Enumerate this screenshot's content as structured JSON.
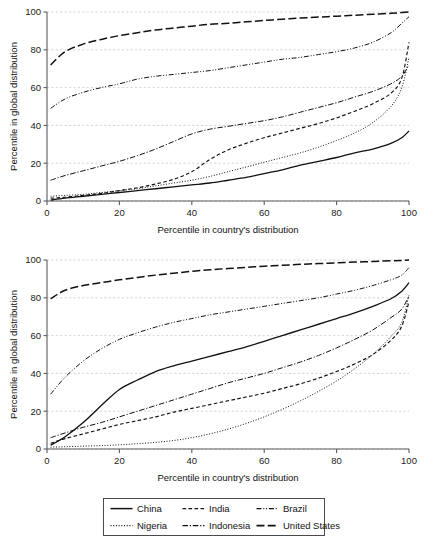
{
  "chart_data": [
    {
      "type": "line",
      "panel": "top",
      "title": "",
      "xlabel": "Percentile in country's distribution",
      "ylabel": "Percentile in global distribution",
      "xlim": [
        0,
        100
      ],
      "ylim": [
        0,
        100
      ],
      "xticks": [
        0,
        20,
        40,
        60,
        80,
        100
      ],
      "yticks": [
        0,
        20,
        40,
        60,
        80,
        100
      ],
      "xtick_labels": [
        "0",
        "20",
        "40",
        "60",
        "80",
        "100"
      ],
      "ytick_labels": [
        "0",
        "20",
        "40",
        "60",
        "80",
        "100"
      ],
      "grid": "horizontal-dashed",
      "legend_position": "below-figure-shared",
      "x": [
        1,
        5,
        10,
        15,
        20,
        25,
        30,
        35,
        40,
        45,
        50,
        55,
        60,
        65,
        70,
        75,
        80,
        85,
        90,
        95,
        98,
        100
      ],
      "series": [
        {
          "name": "China",
          "style": "solid",
          "values": [
            0.5,
            1.5,
            2.5,
            3.5,
            4.5,
            5.5,
            6.5,
            7.5,
            8.5,
            9.5,
            11.0,
            12.5,
            14.5,
            16.5,
            19.0,
            21.0,
            23.0,
            25.5,
            27.5,
            30.5,
            33.5,
            37.0
          ]
        },
        {
          "name": "India",
          "style": "dashed-short",
          "values": [
            1.5,
            2.0,
            3.0,
            4.0,
            5.5,
            7.0,
            9.0,
            11.5,
            15.5,
            22.0,
            27.0,
            30.5,
            33.5,
            36.0,
            38.5,
            41.0,
            44.0,
            47.5,
            51.5,
            57.0,
            65.0,
            84.0
          ]
        },
        {
          "name": "Brazil",
          "style": "dash-dot-dot",
          "values": [
            49.0,
            54.0,
            57.5,
            60.0,
            62.0,
            64.5,
            66.0,
            67.0,
            68.0,
            69.0,
            70.5,
            72.0,
            73.5,
            75.0,
            76.0,
            77.5,
            79.0,
            81.0,
            84.0,
            89.0,
            94.0,
            97.5
          ]
        },
        {
          "name": "Nigeria",
          "style": "dotted",
          "values": [
            2.5,
            3.0,
            3.5,
            4.5,
            5.5,
            6.5,
            8.0,
            9.5,
            11.0,
            13.0,
            15.5,
            18.0,
            20.5,
            23.0,
            25.5,
            28.5,
            32.0,
            36.0,
            41.5,
            50.0,
            60.0,
            76.0
          ]
        },
        {
          "name": "Indonesia",
          "style": "dash-dot",
          "values": [
            11.0,
            13.5,
            16.0,
            18.5,
            21.0,
            24.0,
            27.5,
            31.5,
            35.5,
            38.0,
            39.5,
            41.0,
            42.5,
            44.5,
            47.0,
            49.5,
            52.0,
            55.0,
            58.0,
            62.0,
            66.0,
            72.0
          ]
        },
        {
          "name": "United States",
          "style": "long-dash",
          "values": [
            72.0,
            79.0,
            83.0,
            85.5,
            87.5,
            89.0,
            90.5,
            91.5,
            92.5,
            93.5,
            94.0,
            94.8,
            95.5,
            96.2,
            96.8,
            97.3,
            97.8,
            98.3,
            98.8,
            99.3,
            99.7,
            100.0
          ]
        }
      ]
    },
    {
      "type": "line",
      "panel": "bottom",
      "title": "",
      "xlabel": "Percentile in country's distribution",
      "ylabel": "Percentile in global distribution",
      "xlim": [
        0,
        100
      ],
      "ylim": [
        0,
        100
      ],
      "xticks": [
        0,
        20,
        40,
        60,
        80,
        100
      ],
      "yticks": [
        0,
        20,
        40,
        60,
        80,
        100
      ],
      "xtick_labels": [
        "0",
        "20",
        "40",
        "60",
        "80",
        "100"
      ],
      "ytick_labels": [
        "0",
        "20",
        "40",
        "60",
        "80",
        "100"
      ],
      "grid": "horizontal-dashed",
      "legend_position": "below-figure-shared",
      "x": [
        1,
        5,
        10,
        15,
        20,
        25,
        30,
        35,
        40,
        45,
        50,
        55,
        60,
        65,
        70,
        75,
        80,
        85,
        90,
        95,
        98,
        100
      ],
      "series": [
        {
          "name": "China",
          "style": "solid",
          "values": [
            2.0,
            6.5,
            14.0,
            23.0,
            31.5,
            36.5,
            41.0,
            44.0,
            46.5,
            49.0,
            51.5,
            54.0,
            57.0,
            60.0,
            63.0,
            66.0,
            69.0,
            72.0,
            75.5,
            79.5,
            83.5,
            88.0
          ]
        },
        {
          "name": "India",
          "style": "dashed-short",
          "values": [
            3.0,
            5.5,
            8.0,
            10.5,
            13.0,
            15.0,
            17.0,
            19.5,
            21.5,
            23.5,
            25.5,
            27.5,
            29.5,
            32.0,
            34.5,
            37.5,
            41.0,
            45.0,
            50.0,
            57.5,
            65.0,
            78.0
          ]
        },
        {
          "name": "Brazil",
          "style": "dash-dot-dot",
          "values": [
            29.0,
            38.0,
            46.5,
            53.0,
            58.0,
            61.5,
            64.5,
            67.0,
            69.0,
            71.0,
            72.5,
            74.0,
            75.5,
            77.0,
            78.5,
            80.0,
            82.0,
            84.0,
            86.5,
            89.5,
            92.0,
            96.0
          ]
        },
        {
          "name": "Nigeria",
          "style": "dotted",
          "values": [
            1.0,
            1.2,
            1.5,
            1.8,
            2.2,
            2.8,
            3.5,
            4.5,
            6.0,
            8.0,
            10.5,
            13.5,
            17.0,
            21.0,
            25.5,
            30.5,
            36.0,
            42.5,
            50.0,
            59.5,
            67.0,
            81.5
          ]
        },
        {
          "name": "Indonesia",
          "style": "dash-dot",
          "values": [
            6.0,
            8.5,
            11.5,
            14.0,
            17.0,
            20.0,
            23.0,
            26.0,
            29.0,
            32.0,
            35.0,
            37.5,
            40.0,
            43.0,
            46.0,
            49.5,
            53.5,
            58.0,
            63.0,
            69.5,
            74.0,
            81.0
          ]
        },
        {
          "name": "United States",
          "style": "long-dash",
          "values": [
            79.5,
            84.0,
            86.5,
            88.0,
            89.5,
            90.8,
            92.0,
            93.0,
            94.0,
            94.8,
            95.5,
            96.1,
            96.7,
            97.2,
            97.7,
            98.1,
            98.5,
            98.9,
            99.2,
            99.6,
            99.8,
            100.0
          ]
        }
      ]
    }
  ],
  "legend": {
    "items": [
      {
        "label": "China",
        "style": "solid"
      },
      {
        "label": "India",
        "style": "dashed-short"
      },
      {
        "label": "Brazil",
        "style": "dash-dot-dot"
      },
      {
        "label": "Nigeria",
        "style": "dotted"
      },
      {
        "label": "Indonesia",
        "style": "dash-dot"
      },
      {
        "label": "United States",
        "style": "long-dash"
      }
    ]
  },
  "style": {
    "line_color": "#111111",
    "grid_color": "#c9c9c9",
    "axis_color": "#5b5b5b",
    "background": "#ffffff"
  }
}
